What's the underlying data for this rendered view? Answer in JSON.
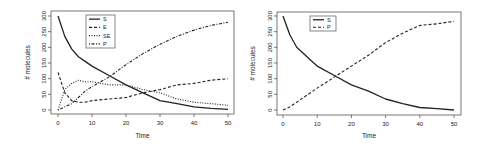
{
  "chart_data": [
    {
      "type": "line",
      "title": "",
      "xlabel": "Time",
      "ylabel": "# molecules",
      "xlim": [
        0,
        50
      ],
      "ylim": [
        0,
        300
      ],
      "xticks": [
        0,
        10,
        20,
        30,
        40,
        50
      ],
      "yticks": [
        0,
        50,
        100,
        150,
        200,
        250,
        300
      ],
      "grid": false,
      "legend_position": "top-left-inside",
      "x": [
        0,
        2,
        4,
        6,
        8,
        10,
        15,
        20,
        25,
        30,
        35,
        40,
        45,
        50
      ],
      "series": [
        {
          "name": "S",
          "style": "solid",
          "values": [
            300,
            235,
            195,
            170,
            155,
            140,
            110,
            80,
            55,
            30,
            20,
            10,
            5,
            2
          ]
        },
        {
          "name": "E",
          "style": "dashed",
          "values": [
            120,
            55,
            30,
            25,
            25,
            30,
            35,
            40,
            55,
            65,
            80,
            85,
            95,
            100
          ]
        },
        {
          "name": "SE",
          "style": "dotted",
          "values": [
            0,
            65,
            85,
            95,
            90,
            90,
            80,
            80,
            65,
            55,
            35,
            25,
            20,
            15
          ]
        },
        {
          "name": "P",
          "style": "dotdash",
          "values": [
            0,
            10,
            20,
            40,
            60,
            75,
            105,
            145,
            180,
            210,
            235,
            255,
            270,
            280
          ]
        }
      ]
    },
    {
      "type": "line",
      "title": "",
      "xlabel": "Time",
      "ylabel": "# molecules",
      "xlim": [
        0,
        50
      ],
      "ylim": [
        0,
        300
      ],
      "xticks": [
        0,
        10,
        20,
        30,
        40,
        50
      ],
      "yticks": [
        0,
        50,
        100,
        150,
        200,
        250,
        300
      ],
      "grid": false,
      "legend_position": "top-left-inside",
      "x": [
        0,
        2,
        4,
        6,
        8,
        10,
        15,
        20,
        25,
        30,
        35,
        40,
        45,
        50
      ],
      "series": [
        {
          "name": "S",
          "style": "solid",
          "values": [
            300,
            240,
            200,
            180,
            160,
            140,
            110,
            80,
            60,
            35,
            20,
            8,
            4,
            0
          ]
        },
        {
          "name": "P",
          "style": "dashed",
          "values": [
            0,
            10,
            25,
            40,
            55,
            70,
            105,
            140,
            175,
            215,
            245,
            270,
            275,
            283
          ]
        }
      ]
    }
  ]
}
